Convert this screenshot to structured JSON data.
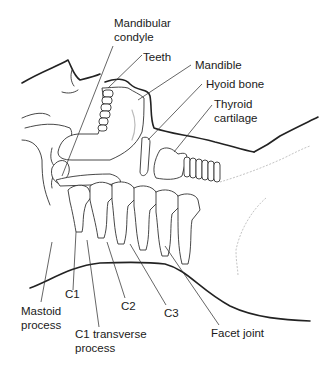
{
  "diagram": {
    "labels": {
      "mandibular_condyle": "Mandibular\ncondyle",
      "teeth": "Teeth",
      "mandible": "Mandible",
      "hyoid_bone": "Hyoid bone",
      "thyroid_cartilage": "Thyroid\ncartilage",
      "mastoid_process": "Mastoid\nprocess",
      "c1": "C1",
      "c1_transverse_process": "C1 transverse\nprocess",
      "c2": "C2",
      "c3": "C3",
      "facet_joint": "Facet joint"
    }
  }
}
